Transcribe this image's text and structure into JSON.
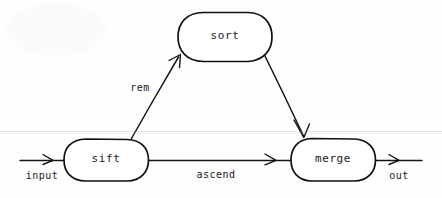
{
  "diagram": {
    "type": "dataflow-graph",
    "background_color": "#fefefe",
    "stroke_color": "#141414",
    "nodes": [
      {
        "id": "sift",
        "label": "sift",
        "shape": "stadium",
        "cx": 106,
        "cy": 160,
        "width": 85,
        "height": 43
      },
      {
        "id": "sort",
        "label": "sort",
        "shape": "stadium",
        "cx": 225,
        "cy": 37,
        "width": 94,
        "height": 50
      },
      {
        "id": "merge",
        "label": "merge",
        "shape": "stadium",
        "cx": 333,
        "cy": 160,
        "width": 84,
        "height": 43
      }
    ],
    "edges": [
      {
        "id": "input-edge",
        "label": "input",
        "from": "external-input",
        "to": "sift",
        "label_x": 42,
        "label_y": 175
      },
      {
        "id": "rem-edge",
        "label": "rem",
        "from": "sift",
        "to": "sort",
        "label_x": 140,
        "label_y": 88
      },
      {
        "id": "sort-merge-edge",
        "label": "",
        "from": "sort",
        "to": "merge",
        "label_x": 0,
        "label_y": 0
      },
      {
        "id": "ascend-edge",
        "label": "ascend",
        "from": "sift",
        "to": "merge",
        "label_x": 216,
        "label_y": 174
      },
      {
        "id": "out-edge",
        "label": "out",
        "from": "merge",
        "to": "external-output",
        "label_x": 399,
        "label_y": 175
      }
    ]
  }
}
